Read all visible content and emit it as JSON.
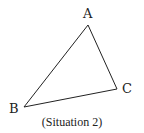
{
  "diagram": {
    "type": "triangle",
    "vertices": [
      {
        "name": "A",
        "x": 88,
        "y": 25,
        "label_x": 83,
        "label_y": 7
      },
      {
        "name": "C",
        "x": 117,
        "y": 89,
        "label_x": 122,
        "label_y": 82
      },
      {
        "name": "B",
        "x": 24,
        "y": 107,
        "label_x": 9,
        "label_y": 102
      }
    ],
    "edges": [
      [
        "A",
        "C"
      ],
      [
        "C",
        "B"
      ],
      [
        "B",
        "A"
      ]
    ],
    "stroke_color": "#222222",
    "caption": "(Situation 2)"
  }
}
